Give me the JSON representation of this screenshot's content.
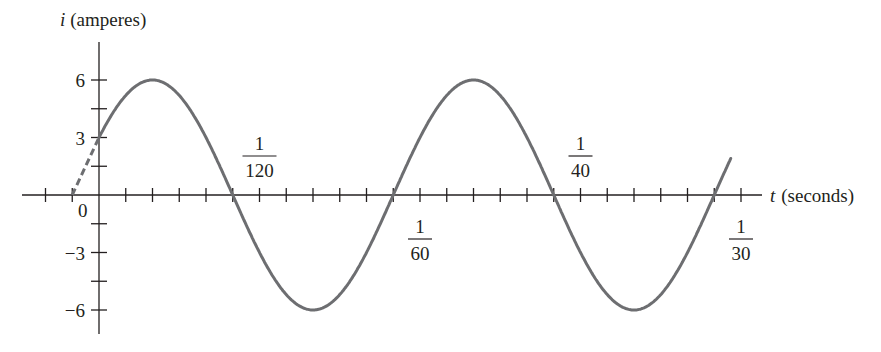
{
  "chart_data": {
    "type": "line",
    "title": "",
    "xlabel_var": "t",
    "xlabel_unit": "(seconds)",
    "ylabel_var": "i",
    "ylabel_unit": "(amperes)",
    "function": "i = 6 sin(120πt + π/6)",
    "amplitude": 6,
    "frequency_hz": 60,
    "phase_rad": 0.5236,
    "y_ticks": [
      {
        "value": 6,
        "label": "6"
      },
      {
        "value": 3,
        "label": "3"
      },
      {
        "value": -3,
        "label": "−3"
      },
      {
        "value": -6,
        "label": "−6"
      }
    ],
    "y_minor_ticks": [
      4.5,
      1.5,
      -1.5,
      -4.5
    ],
    "origin_label": "0",
    "x_tick_step": "1/720",
    "x_labels": [
      {
        "value": 0.008333,
        "num": "1",
        "den": "120",
        "position": "above"
      },
      {
        "value": 0.016667,
        "num": "1",
        "den": "60",
        "position": "below"
      },
      {
        "value": 0.025,
        "num": "1",
        "den": "40",
        "position": "above"
      },
      {
        "value": 0.033333,
        "num": "1",
        "den": "30",
        "position": "below"
      }
    ],
    "xlim": [
      -0.0035,
      0.0368
    ],
    "ylim": [
      -7.5,
      8.5
    ],
    "points": [
      {
        "t": 0,
        "i": 3
      },
      {
        "t": 0.002778,
        "i": 6
      },
      {
        "t": 0.006944,
        "i": 0
      },
      {
        "t": 0.011111,
        "i": -6
      },
      {
        "t": 0.015278,
        "i": 0
      },
      {
        "t": 0.019444,
        "i": 6
      },
      {
        "t": 0.023611,
        "i": 0
      },
      {
        "t": 0.027778,
        "i": -6
      },
      {
        "t": 0.031944,
        "i": 0
      }
    ],
    "dashed_extension": {
      "from_t": -0.001389,
      "from_i": 0,
      "to_t": 0,
      "to_i": 3
    },
    "line_color": "#6d6e71",
    "axis_color": "#231f20",
    "grid": false,
    "legend": null
  }
}
